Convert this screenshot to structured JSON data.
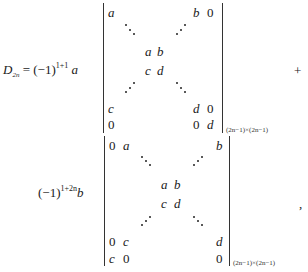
{
  "formula": {
    "lhs": {
      "symbol": "D",
      "subscript": "2n",
      "equals": "="
    },
    "term1": {
      "coef_base": "(−1)",
      "coef_exp": "1+1",
      "coef_var": "a",
      "matrix": {
        "row_top": [
          "a",
          "b",
          "0"
        ],
        "center_row1": [
          "a",
          "b"
        ],
        "center_row2": [
          "c",
          "d"
        ],
        "row_penult": [
          "c",
          "d",
          "0"
        ],
        "row_bottom": [
          "0",
          "0",
          "d"
        ]
      },
      "size": "(2n−1)×(2n−1)",
      "operator": "+"
    },
    "term2": {
      "coef_base": "(−1)",
      "coef_exp": "1+2n",
      "coef_var": "b",
      "matrix": {
        "row_top": [
          "0",
          "a",
          "b"
        ],
        "center_row1": [
          "a",
          "b"
        ],
        "center_row2": [
          "c",
          "d"
        ],
        "row_penult": [
          "0",
          "c",
          "d"
        ],
        "row_bottom": [
          "c",
          "0",
          "0"
        ]
      },
      "size": "(2n−1)×(2n−1)",
      "trailing": ","
    }
  }
}
